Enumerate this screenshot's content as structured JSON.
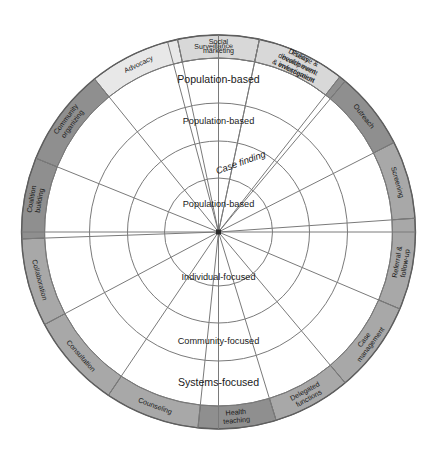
{
  "diagram": {
    "name": "public-health-intervention-wheel",
    "type": "concentric-wheel",
    "geometry": {
      "cx": 218.5,
      "cy": 232,
      "r_outer": 197,
      "r_band_inner": 174,
      "r_ring1": 129,
      "r_ring2": 91,
      "r_ring3": 54
    },
    "colors": {
      "dark_gray": "#8f8f8f",
      "medium_gray": "#a8a8a8",
      "light_gray": "#d8d8d8",
      "very_light_gray": "#e8e8e8",
      "white": "#ffffff",
      "stroke": "#6e6e6e",
      "text": "#1a1a1a"
    },
    "outer_ring": {
      "name": "intervention-segments",
      "segments": [
        {
          "label": "Surveillance",
          "a0": -105,
          "a1": -78,
          "shade": "dark_gray",
          "lines": [
            "Surveillance"
          ],
          "rot": "tangent"
        },
        {
          "label": "Disease & health event investigation",
          "a0": -78,
          "a1": -50,
          "shade": "dark_gray",
          "lines": [
            "Disease &",
            "health event",
            "investigation"
          ],
          "rot": "tangent"
        },
        {
          "label": "Outreach",
          "a0": -50,
          "a1": -27,
          "shade": "dark_gray",
          "lines": [
            "Outreach"
          ],
          "rot": "tangent"
        },
        {
          "label": "Screening",
          "a0": -27,
          "a1": -4,
          "shade": "medium_gray",
          "lines": [
            "Screening"
          ],
          "rot": "tangent"
        },
        {
          "label": "Referral & follow-up",
          "a0": -4,
          "a1": 23,
          "shade": "medium_gray",
          "lines": [
            "Referral &",
            "follow-up"
          ],
          "rot": "tangent"
        },
        {
          "label": "Case management",
          "a0": 23,
          "a1": 50,
          "shade": "medium_gray",
          "lines": [
            "Case",
            "management"
          ],
          "rot": "tangent"
        },
        {
          "label": "Delegated functions",
          "a0": 50,
          "a1": 73,
          "shade": "medium_gray",
          "lines": [
            "Delegated",
            "functions"
          ],
          "rot": "tangent"
        },
        {
          "label": "Health teaching",
          "a0": 73,
          "a1": 96,
          "shade": "dark_gray",
          "lines": [
            "Health",
            "teaching"
          ],
          "rot": "tangent"
        },
        {
          "label": "Counseling",
          "a0": 96,
          "a1": 124,
          "shade": "medium_gray",
          "lines": [
            "Counseling"
          ],
          "rot": "tangent"
        },
        {
          "label": "Consultation",
          "a0": 124,
          "a1": 152,
          "shade": "medium_gray",
          "lines": [
            "Consultation"
          ],
          "rot": "tangent"
        },
        {
          "label": "Collaboration",
          "a0": 152,
          "a1": 178,
          "shade": "medium_gray",
          "lines": [
            "Collaboration"
          ],
          "rot": "tangent"
        },
        {
          "label": "Coalition building",
          "a0": 178,
          "a1": 202,
          "shade": "dark_gray",
          "lines": [
            "Coalition",
            "building"
          ],
          "rot": "tangent"
        },
        {
          "label": "Community organizing",
          "a0": 202,
          "a1": 231,
          "shade": "dark_gray",
          "lines": [
            "Community",
            "organizing"
          ],
          "rot": "tangent"
        },
        {
          "label": "Advocacy",
          "a0": 231,
          "a1": 258,
          "shade": "very_light_gray",
          "lines": [
            "Advocacy"
          ],
          "rot": "tangent"
        },
        {
          "label": "Social marketing",
          "a0": 258,
          "a1": 282,
          "shade": "light_gray",
          "lines": [
            "Social",
            "marketing"
          ],
          "rot": "tangent"
        },
        {
          "label": "Policy development & enforcement",
          "a0": 282,
          "a1": 308,
          "shade": "light_gray",
          "lines": [
            "Policy",
            "development",
            "& enforcement"
          ],
          "rot": "tangent"
        },
        {
          "label": "Surveillance-gap",
          "a0": 308,
          "a1": 255,
          "shade": "none",
          "lines": [],
          "rot": "tangent"
        }
      ]
    },
    "inner_rings": [
      {
        "name": "ring-outer",
        "label": "Population-based",
        "r_in": 129,
        "r_out": 174,
        "angle": -90,
        "style": "normal"
      },
      {
        "name": "ring-second",
        "label": "Population-based",
        "r_in": 91,
        "r_out": 129,
        "angle": -90,
        "style": "small"
      },
      {
        "name": "ring-third",
        "label": "Case finding",
        "r_in": 54,
        "r_out": 91,
        "angle": -72,
        "style": "italic"
      },
      {
        "name": "ring-inner",
        "label": "Population-based",
        "r_in": 0,
        "r_out": 54,
        "angle": -90,
        "style": "small"
      },
      {
        "name": "ring-lower-inner",
        "label": "Individual-focused",
        "r_in": 0,
        "r_out": 91,
        "angle": 90,
        "style": "small"
      },
      {
        "name": "ring-lower-middle",
        "label": "Community-focused",
        "r_in": 91,
        "r_out": 129,
        "angle": 90,
        "style": "small"
      },
      {
        "name": "ring-lower-outer",
        "label": "Systems-focused",
        "r_in": 129,
        "r_out": 174,
        "angle": 90,
        "style": "normal"
      }
    ],
    "inner_labels": {
      "population_based_1": "Population-based",
      "population_based_2": "Population-based",
      "case_finding": "Case finding",
      "population_based_3": "Population-based",
      "individual_focused": "Individual-focused",
      "community_focused": "Community-focused",
      "systems_focused": "Systems-focused"
    }
  }
}
